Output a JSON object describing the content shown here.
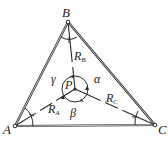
{
  "figure": {
    "vertices": {
      "A": {
        "label": "A",
        "x": 15,
        "y": 126
      },
      "B": {
        "label": "B",
        "x": 68,
        "y": 22
      },
      "C": {
        "label": "C",
        "x": 155,
        "y": 125
      }
    },
    "interior_point": {
      "label": "P",
      "x": 75,
      "y": 89
    },
    "segments": [
      {
        "from": "P",
        "to": "A",
        "label": "R",
        "subscript": "A"
      },
      {
        "from": "P",
        "to": "B",
        "label": "R",
        "subscript": "B"
      },
      {
        "from": "P",
        "to": "C",
        "label": "R",
        "subscript": "C"
      }
    ],
    "angles": {
      "alpha": "α",
      "beta": "β",
      "gamma": "γ"
    },
    "colors": {
      "stroke": "#2a2a2a",
      "background": "#ffffff"
    }
  }
}
